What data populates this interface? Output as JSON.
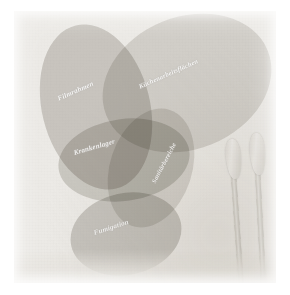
{
  "image": {
    "title": "Faded photographic scan of overlapping ellipse diagram",
    "background_color": "#ffffff",
    "plate_color": "#eceae6",
    "label_color": "#ffffff",
    "blob_color": "#b9b6b0"
  },
  "diagram": {
    "type": "venn-ellipses",
    "blobs": [
      {
        "id": "blob-filmrahmen",
        "label": "Filmrahmen",
        "fill": "#b7b4ae",
        "opacity": 0.55,
        "left": 28,
        "top": 12,
        "width": 108,
        "height": 168,
        "rotate": -14
      },
      {
        "id": "blob-kuechenarbeitsflaechen",
        "label": "Küchenarbeitsflächen",
        "fill": "#c2bfb9",
        "opacity": 0.48,
        "left": 86,
        "top": 6,
        "width": 174,
        "height": 132,
        "rotate": -22
      },
      {
        "id": "blob-krankenlager",
        "label": "Krankenlager",
        "fill": "#bab7b1",
        "opacity": 0.52,
        "left": 44,
        "top": 108,
        "width": 132,
        "height": 82,
        "rotate": -8
      },
      {
        "id": "blob-sanitaerbereiche",
        "label": "Sanitärbereiche",
        "fill": "#c4c1bb",
        "opacity": 0.46,
        "left": 96,
        "top": 96,
        "width": 82,
        "height": 122,
        "rotate": 18
      },
      {
        "id": "blob-fumigation",
        "label": "Fumigation",
        "fill": "#b5b2ac",
        "opacity": 0.55,
        "left": 56,
        "top": 182,
        "width": 112,
        "height": 82,
        "rotate": -12
      }
    ],
    "labels": [
      {
        "text": "Filmrahmen",
        "left": 44,
        "top": 84,
        "rotate": -24,
        "size": 7.0
      },
      {
        "text": "Küchenarbeitsflächen",
        "left": 125,
        "top": 72,
        "rotate": -24,
        "size": 6.6
      },
      {
        "text": "Krankenlager",
        "left": 60,
        "top": 138,
        "rotate": -16,
        "size": 7.0
      },
      {
        "text": "Sanitärbereiche",
        "left": 139,
        "top": 168,
        "rotate": -62,
        "size": 6.4
      },
      {
        "text": "Fumigation",
        "left": 80,
        "top": 218,
        "rotate": -18,
        "size": 7.0
      }
    ]
  },
  "objects": {
    "swabs": [
      {
        "id": "swab-left",
        "name": "cotton-swab",
        "head_left": 14,
        "head_top": 6,
        "head_width": 15,
        "head_height": 40,
        "head_rotate": -5,
        "stick_left": 19,
        "stick_top": 42,
        "stick_width": 5,
        "stick_height": 128,
        "stick_rotate": -4
      },
      {
        "id": "swab-right",
        "name": "cotton-swab",
        "head_left": 38,
        "head_top": 0,
        "head_width": 15,
        "head_height": 42,
        "head_rotate": -4,
        "stick_left": 43,
        "stick_top": 37,
        "stick_width": 5,
        "stick_height": 133,
        "stick_rotate": -3
      }
    ],
    "swab_group": {
      "left": 198,
      "top": 122,
      "width": 62,
      "height": 178
    }
  }
}
